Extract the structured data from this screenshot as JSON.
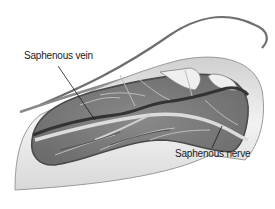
{
  "figure": {
    "labels": [
      {
        "id": "vein",
        "text": "Saphenous vein"
      },
      {
        "id": "nerve",
        "text": "Saphenous nerve"
      }
    ]
  },
  "colors": {
    "background": "#ffffff",
    "skin": "#ececec",
    "skin_edge": "#6e6e6e",
    "incision": "#7a7a7a",
    "vein": "#3a3a3a",
    "nerve": "#d8d8d8",
    "leader": "#1a1a1a"
  }
}
